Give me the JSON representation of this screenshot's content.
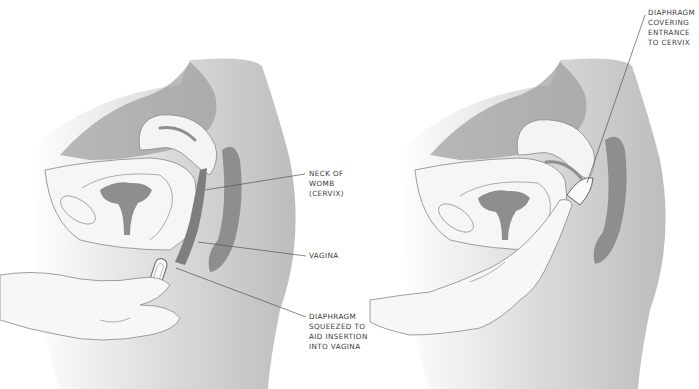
{
  "figure": {
    "left_panel": {
      "name": "Diaphragm insertion",
      "labels": [
        {
          "id": "cervix",
          "text": "NECK OF\nWOMB\n(CERVIX)"
        },
        {
          "id": "vagina",
          "text": "VAGINA"
        },
        {
          "id": "diaphragm",
          "text": "DIAPHRAGM\nSQUEEZED TO\nAID INSERTION\nINTO VAGINA"
        }
      ]
    },
    "right_panel": {
      "name": "Diaphragm in place",
      "labels": [
        {
          "id": "diaphragm-covering",
          "text": "DIAPHRAGM\nCOVERING\nENTRANCE\nTO CERVIX"
        }
      ]
    },
    "colors": {
      "skin_light": "#f4f4f4",
      "skin_mid": "#d2d2d2",
      "organ_dark": "#8e8e8e",
      "organ_mid": "#b0b0b0",
      "line": "#555555",
      "text": "#3a3a3a"
    }
  }
}
